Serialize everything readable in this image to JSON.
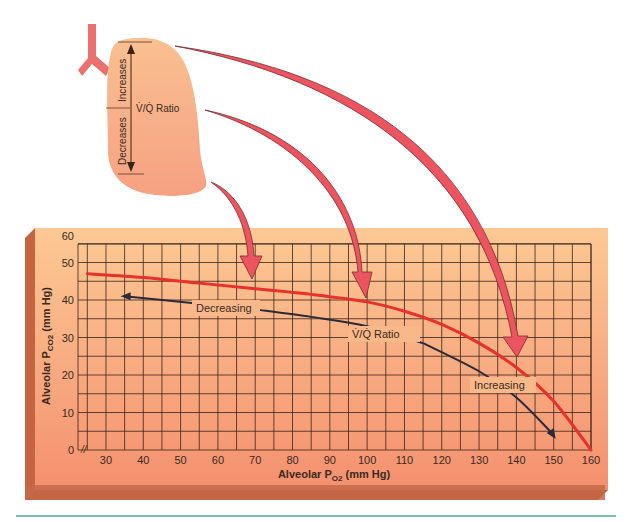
{
  "lung": {
    "ratio_label": "V̇/Q̇ Ratio",
    "top_label": "Increases",
    "bottom_label": "Decreases"
  },
  "chart_data": {
    "type": "line",
    "title": "",
    "xlabel": "Alveolar PO2 (mm Hg)",
    "ylabel": "Alveolar PCO2 (mm Hg)",
    "xlim": [
      22,
      160
    ],
    "ylim": [
      0,
      60
    ],
    "x_ticks": [
      30,
      40,
      50,
      60,
      70,
      80,
      90,
      100,
      110,
      120,
      130,
      140,
      150,
      160
    ],
    "y_ticks": [
      0,
      10,
      20,
      30,
      40,
      50,
      60
    ],
    "grid": true,
    "axis_break": "x",
    "series": [
      {
        "name": "O2-CO2 diagram curve",
        "color": "#e8302c",
        "x": [
          25,
          40,
          55,
          70,
          85,
          100,
          110,
          120,
          130,
          140,
          150,
          160
        ],
        "y": [
          47,
          46,
          44.5,
          43,
          41.5,
          39.5,
          37,
          33.5,
          28.5,
          22,
          13,
          0
        ]
      },
      {
        "name": "V/Q ratio direction",
        "color": "#2a2a3a",
        "x": [
          35,
          55,
          70,
          85,
          100,
          115,
          130,
          140,
          150
        ],
        "y": [
          41,
          39,
          37.5,
          35.5,
          33,
          28.5,
          21,
          14,
          4
        ]
      }
    ],
    "annotations": [
      {
        "text": "Decreasing",
        "x": 62,
        "y": 38
      },
      {
        "text": "V̇/Q̇ Ratio",
        "x": 104,
        "y": 31
      },
      {
        "text": "Increasing",
        "x": 140,
        "y": 18
      }
    ],
    "pointer_arrows": [
      {
        "from": "lung base",
        "to_x": 70,
        "to_y": 43
      },
      {
        "from": "lung middle",
        "to_x": 100,
        "to_y": 39.5
      },
      {
        "from": "lung apex",
        "to_x": 140,
        "to_y": 22
      }
    ]
  },
  "text": {
    "y_tick_labels": [
      "0",
      "10",
      "20",
      "30",
      "40",
      "50",
      "60"
    ],
    "x_tick_labels": [
      "30",
      "40",
      "50",
      "60",
      "70",
      "80",
      "90",
      "100",
      "110",
      "120",
      "130",
      "140",
      "150",
      "160"
    ],
    "xlabel_main": "Alveolar P",
    "xlabel_sub": "O2",
    "xlabel_unit": " (mm Hg)",
    "ylabel_main": "Alveolar P",
    "ylabel_sub": "CO2",
    "ylabel_unit": " (mm Hg)",
    "annot_decreasing": "Decreasing",
    "annot_ratio": "V̇/Q̇ Ratio",
    "annot_increasing": "Increasing",
    "axis_break_glyph": "//"
  },
  "colors": {
    "panel_light": "#fbc690",
    "panel_dark": "#f3906e",
    "panel_side": "#c0603e",
    "grid": "#3a2418",
    "red_curve": "#e8302c",
    "dark_curve": "#2a2a3a",
    "lung_fill": "#f8b88c",
    "arrow_fill": "#ec5560",
    "teal_rule": "#4ea89a"
  }
}
